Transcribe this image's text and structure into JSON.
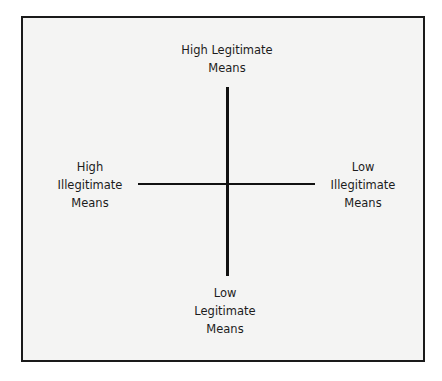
{
  "diagram": {
    "type": "two-axis quadrant",
    "labels": {
      "top": [
        "High Legitimate",
        "Means"
      ],
      "left": [
        "High",
        "Illegitimate",
        "Means"
      ],
      "right": [
        "Low",
        "Illegitimate",
        "Means"
      ],
      "bottom": [
        "Low",
        "Legitimate",
        "Means"
      ]
    },
    "axes": {
      "vertical": {
        "from": "High Legitimate Means",
        "to": "Low Legitimate Means"
      },
      "horizontal": {
        "from": "High Illegitimate Means",
        "to": "Low Illegitimate Means"
      }
    },
    "colors": {
      "line": "#111111",
      "border": "#1a1a1a",
      "background": "#f4f4f3",
      "text": "#1c1c1c"
    }
  }
}
